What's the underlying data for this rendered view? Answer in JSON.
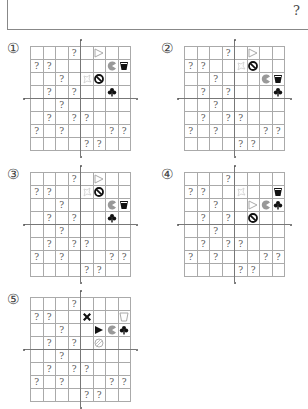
{
  "question_mark_top": "?",
  "grid": {
    "rows": 8,
    "cols": 8
  },
  "icon_colors": {
    "black": "#111111",
    "gray": "#999999",
    "light": "#cccccc",
    "outline": "#aaaaaa"
  },
  "question_cells": [
    [
      0,
      3
    ],
    [
      1,
      0
    ],
    [
      1,
      1
    ],
    [
      2,
      2
    ],
    [
      3,
      1
    ],
    [
      3,
      3
    ],
    [
      4,
      2
    ],
    [
      5,
      1
    ],
    [
      5,
      3
    ],
    [
      5,
      4
    ],
    [
      6,
      0
    ],
    [
      6,
      2
    ],
    [
      6,
      6
    ],
    [
      6,
      7
    ],
    [
      7,
      4
    ],
    [
      7,
      5
    ]
  ],
  "panels": [
    {
      "label": "①",
      "left": 30,
      "top": 46,
      "label_x": 7,
      "label_y": 40,
      "icons": [
        {
          "r": 0,
          "c": 5,
          "type": "triangle-outline"
        },
        {
          "r": 1,
          "c": 6,
          "type": "pacman-gray"
        },
        {
          "r": 1,
          "c": 7,
          "type": "cup-black"
        },
        {
          "r": 2,
          "c": 4,
          "type": "burst-outline"
        },
        {
          "r": 2,
          "c": 5,
          "type": "prohibit-black"
        },
        {
          "r": 3,
          "c": 6,
          "type": "club-black"
        }
      ]
    },
    {
      "label": "②",
      "left": 184,
      "top": 46,
      "label_x": 161,
      "label_y": 40,
      "icons": [
        {
          "r": 0,
          "c": 5,
          "type": "triangle-outline"
        },
        {
          "r": 1,
          "c": 4,
          "type": "burst-outline"
        },
        {
          "r": 1,
          "c": 5,
          "type": "prohibit-black"
        },
        {
          "r": 2,
          "c": 6,
          "type": "pacman-gray"
        },
        {
          "r": 2,
          "c": 7,
          "type": "cup-black"
        },
        {
          "r": 3,
          "c": 7,
          "type": "club-black"
        }
      ]
    },
    {
      "label": "③",
      "left": 30,
      "top": 172,
      "label_x": 7,
      "label_y": 166,
      "icons": [
        {
          "r": 0,
          "c": 5,
          "type": "triangle-outline"
        },
        {
          "r": 1,
          "c": 4,
          "type": "burst-outline"
        },
        {
          "r": 1,
          "c": 5,
          "type": "prohibit-black"
        },
        {
          "r": 2,
          "c": 6,
          "type": "pacman-gray"
        },
        {
          "r": 2,
          "c": 7,
          "type": "cup-black"
        },
        {
          "r": 3,
          "c": 6,
          "type": "club-black"
        }
      ]
    },
    {
      "label": "④",
      "left": 184,
      "top": 172,
      "label_x": 161,
      "label_y": 166,
      "icons": [
        {
          "r": 1,
          "c": 4,
          "type": "burst-outline"
        },
        {
          "r": 1,
          "c": 7,
          "type": "cup-black"
        },
        {
          "r": 2,
          "c": 5,
          "type": "triangle-outline"
        },
        {
          "r": 2,
          "c": 6,
          "type": "pacman-gray"
        },
        {
          "r": 2,
          "c": 7,
          "type": "club-black"
        },
        {
          "r": 3,
          "c": 5,
          "type": "prohibit-black"
        }
      ]
    },
    {
      "label": "⑤",
      "left": 30,
      "top": 297,
      "label_x": 7,
      "label_y": 291,
      "icons": [
        {
          "r": 1,
          "c": 4,
          "type": "cross-black"
        },
        {
          "r": 1,
          "c": 7,
          "type": "cup-outline"
        },
        {
          "r": 2,
          "c": 5,
          "type": "triangle-black"
        },
        {
          "r": 2,
          "c": 6,
          "type": "pacman-gray"
        },
        {
          "r": 2,
          "c": 7,
          "type": "club-black"
        },
        {
          "r": 3,
          "c": 5,
          "type": "circle-hatched"
        }
      ]
    }
  ]
}
